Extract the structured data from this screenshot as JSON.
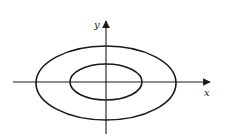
{
  "diagram": {
    "type": "concentric ellipses on coordinate axes",
    "axes": {
      "x_label": "x",
      "y_label": "y",
      "origin": [
        106,
        82
      ],
      "x_axis": {
        "from": [
          13,
          82
        ],
        "to": [
          212,
          82
        ]
      },
      "y_axis": {
        "from": [
          106,
          134
        ],
        "to": [
          106,
          19
        ]
      }
    },
    "ellipses": [
      {
        "name": "outer",
        "cx": 106,
        "cy": 83,
        "rx": 70,
        "ry": 37
      },
      {
        "name": "inner",
        "cx": 106,
        "cy": 82,
        "rx": 36,
        "ry": 18
      }
    ],
    "stroke_color": "#1a1a1a",
    "background": "#ffffff"
  }
}
